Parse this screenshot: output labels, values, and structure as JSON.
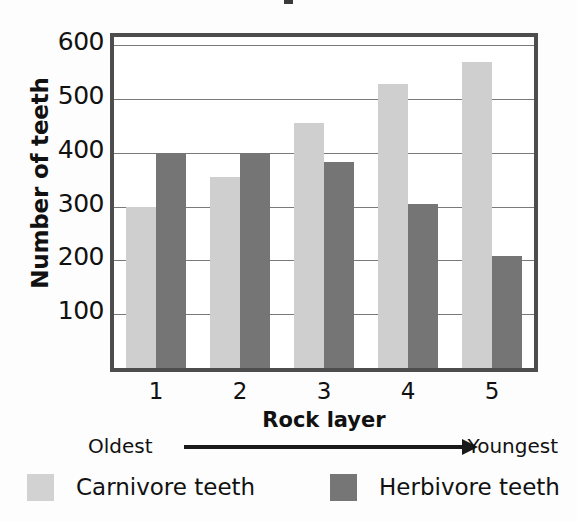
{
  "chart_data": {
    "type": "bar",
    "title": "",
    "xlabel": "Rock layer",
    "ylabel": "Number of teeth",
    "categories": [
      "1",
      "2",
      "3",
      "4",
      "5"
    ],
    "series": [
      {
        "name": "Carnivore teeth",
        "color": "#cfcfcf",
        "values": [
          300,
          355,
          455,
          527,
          568
        ]
      },
      {
        "name": "Herbivore teeth",
        "color": "#757575",
        "values": [
          400,
          400,
          382,
          305,
          208
        ]
      }
    ],
    "ylim": [
      0,
      615
    ],
    "yticks": [
      100,
      200,
      300,
      400,
      500,
      600
    ],
    "ytick_labels": [
      "100",
      "200",
      "300",
      "400",
      "500",
      "600"
    ],
    "grid": true,
    "legend_position": "bottom",
    "annotations": {
      "axis_direction_left": "Oldest",
      "axis_direction_right": "Youngest",
      "arrow": "right-arrow"
    }
  },
  "axes": {
    "y_title": "Number of teeth",
    "x_title": "Rock layer",
    "y_tick_labels": [
      "600",
      "500",
      "400",
      "300",
      "200",
      "100"
    ],
    "x_tick_labels": [
      "1",
      "2",
      "3",
      "4",
      "5"
    ]
  },
  "direction": {
    "oldest_label": "Oldest",
    "youngest_label": "Youngest"
  },
  "legend": {
    "items": [
      {
        "label": "Carnivore teeth",
        "color": "#d2d2d2"
      },
      {
        "label": "Herbivore teeth",
        "color": "#767676"
      }
    ]
  }
}
